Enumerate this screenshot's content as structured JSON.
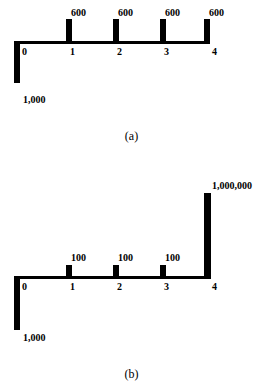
{
  "chart_data": [
    {
      "type": "bar",
      "id": "a",
      "caption": "(a)",
      "title": "",
      "xlabel": "",
      "ylabel": "",
      "categories": [
        "0",
        "1",
        "2",
        "3",
        "4"
      ],
      "tick_labels": [
        "0",
        "1",
        "2",
        "3",
        "4"
      ],
      "values": [
        -1000,
        600,
        600,
        600,
        600
      ],
      "value_labels": [
        "1,000",
        "600",
        "600",
        "600",
        "600"
      ],
      "directions": [
        "down",
        "up",
        "up",
        "up",
        "up"
      ],
      "grid": false,
      "legend": "none",
      "axis_orientation": "horizontal-timeline",
      "bar_color": "#000000",
      "axis_color": "#000000"
    },
    {
      "type": "bar",
      "id": "b",
      "caption": "(b)",
      "title": "",
      "xlabel": "",
      "ylabel": "",
      "categories": [
        "0",
        "1",
        "2",
        "3",
        "4"
      ],
      "tick_labels": [
        "0",
        "1",
        "2",
        "3",
        "4"
      ],
      "values": [
        -1000,
        100,
        100,
        100,
        1000000
      ],
      "value_labels": [
        "1,000",
        "100",
        "100",
        "100",
        "1,000,000"
      ],
      "directions": [
        "down",
        "up",
        "up",
        "up",
        "up"
      ],
      "grid": false,
      "legend": "none",
      "axis_orientation": "horizontal-timeline",
      "bar_color": "#000000",
      "axis_color": "#000000"
    }
  ],
  "figures": {
    "a": {
      "caption": "(a)",
      "amounts": {
        "t0": "1,000",
        "t1": "600",
        "t2": "600",
        "t3": "600",
        "t4": "600"
      },
      "ticks": {
        "t0": "0",
        "t1": "1",
        "t2": "2",
        "t3": "3",
        "t4": "4"
      }
    },
    "b": {
      "caption": "(b)",
      "amounts": {
        "t0": "1,000",
        "t1": "100",
        "t2": "100",
        "t3": "100",
        "t4": "1,000,000"
      },
      "ticks": {
        "t0": "0",
        "t1": "1",
        "t2": "2",
        "t3": "3",
        "t4": "4"
      }
    }
  }
}
